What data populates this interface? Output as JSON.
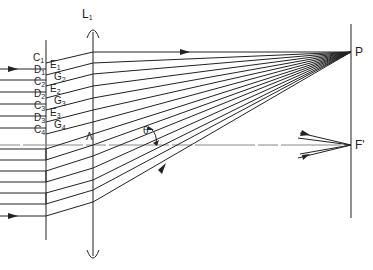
{
  "diagram": {
    "lens_label": "L",
    "lens_sub": "1",
    "point_p": "P",
    "focus_label": "F'",
    "angle_label": "θ",
    "wavelength_label": "Λ",
    "grating_labels": [
      {
        "main": "C",
        "sub": "1",
        "x": 33,
        "y": 58
      },
      {
        "main": "D",
        "sub": "1",
        "x": 34,
        "y": 70
      },
      {
        "main": "E",
        "sub": "1",
        "x": 50,
        "y": 65
      },
      {
        "main": "C",
        "sub": "2",
        "x": 34,
        "y": 82
      },
      {
        "main": "G",
        "sub": "2",
        "x": 54,
        "y": 77
      },
      {
        "main": "D",
        "sub": "2",
        "x": 34,
        "y": 94
      },
      {
        "main": "E",
        "sub": "2",
        "x": 50,
        "y": 89
      },
      {
        "main": "C",
        "sub": "3",
        "x": 34,
        "y": 106
      },
      {
        "main": "G",
        "sub": "3",
        "x": 54,
        "y": 101
      },
      {
        "main": "D",
        "sub": "3",
        "x": 34,
        "y": 118
      },
      {
        "main": "E",
        "sub": "3",
        "x": 50,
        "y": 113
      },
      {
        "main": "C",
        "sub": "4",
        "x": 34,
        "y": 130
      },
      {
        "main": "G",
        "sub": "4",
        "x": 54,
        "y": 125
      }
    ]
  }
}
